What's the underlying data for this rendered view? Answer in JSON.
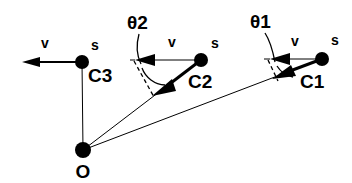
{
  "figure": {
    "type": "vector-geometry-diagram",
    "background_color": "#ffffff",
    "stroke_color": "#000000"
  },
  "points": {
    "origin": {
      "label": "O",
      "x": 83,
      "y": 150
    },
    "c1": {
      "label": "C1",
      "x": 322,
      "y": 59
    },
    "c2": {
      "label": "C2",
      "x": 201,
      "y": 60
    },
    "c3": {
      "label": "C3",
      "x": 82,
      "y": 62
    }
  },
  "speed_labels": {
    "c1": "s",
    "c2": "s",
    "c3": "s"
  },
  "velocity_labels": {
    "c1": "v",
    "c2": "v",
    "c3": "v"
  },
  "angle_labels": {
    "theta1": "θ1",
    "theta2": "θ2"
  },
  "legend": {
    "point_labels": [
      "C3",
      "C2",
      "C1",
      "O"
    ],
    "vector_labels": [
      "v",
      "v",
      "v"
    ],
    "speed_markers": [
      "s",
      "s",
      "s"
    ],
    "angles": [
      "θ2",
      "θ1"
    ]
  }
}
